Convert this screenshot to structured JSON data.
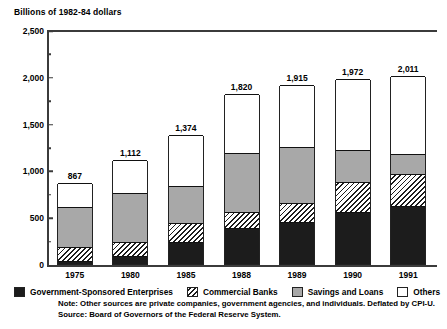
{
  "chart_data": {
    "type": "bar",
    "stacked": true,
    "title": "Billions of 1982-84 dollars",
    "xlabel": "",
    "ylabel": "Billions of 1982-84 dollars",
    "ylim": [
      0,
      2500
    ],
    "grid": false,
    "legend_position": "bottom",
    "categories": [
      "1975",
      "1980",
      "1985",
      "1988",
      "1989",
      "1990",
      "1991"
    ],
    "ytick_labels": [
      "0",
      "500",
      "1,000",
      "1,500",
      "2,000",
      "2,500"
    ],
    "ytick_values": [
      0,
      500,
      1000,
      1500,
      2000,
      2500
    ],
    "yminor_step": 250,
    "totals": [
      867,
      1112,
      1374,
      1820,
      1915,
      1972,
      2011
    ],
    "total_labels": [
      "867",
      "1,112",
      "1,374",
      "1,820",
      "1,915",
      "1,972",
      "2,011"
    ],
    "series": [
      {
        "name": "Government-Sponsored Enterprises",
        "fill": "solid-black",
        "color": "#1c1c1c",
        "values": [
          35,
          85,
          230,
          380,
          450,
          560,
          620
        ]
      },
      {
        "name": "Commercial Banks",
        "fill": "diagonal-hatch",
        "color": "#ffffff",
        "values": [
          145,
          155,
          210,
          180,
          200,
          320,
          340
        ]
      },
      {
        "name": "Savings and Loans",
        "fill": "solid-gray",
        "color": "#a8a8a8",
        "values": [
          430,
          520,
          390,
          630,
          600,
          340,
          220
        ]
      },
      {
        "name": "Others",
        "fill": "solid-white",
        "color": "#ffffff",
        "values": [
          257,
          352,
          544,
          630,
          665,
          752,
          831
        ]
      }
    ],
    "notes": [
      "Note:  Other sources are private companies, government agencies, and individuals.  Deflated by CPI-U.",
      "Source:  Board of Governors of the Federal Reserve System."
    ]
  },
  "legend": {
    "items": [
      {
        "label": "Government-Sponsored Enterprises",
        "swatch": "solid-black-swatch"
      },
      {
        "label": "Commercial Banks",
        "swatch": "hatch-swatch"
      },
      {
        "label": "Savings and Loans",
        "swatch": "gray-swatch"
      },
      {
        "label": "Others",
        "swatch": "white-swatch"
      }
    ]
  }
}
